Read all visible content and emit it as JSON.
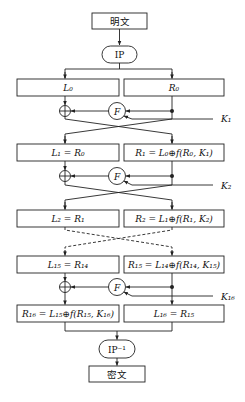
{
  "diagram": {
    "plaintext_label": "明文",
    "ciphertext_label": "密文",
    "initial_permutation": "IP",
    "final_permutation": "IP⁻¹",
    "round_function_label": "F",
    "rounds": [
      {
        "index": 0,
        "left": "L₀",
        "right": "R₀",
        "key": "K₁"
      },
      {
        "index": 1,
        "left": "L₁ = R₀",
        "right": "R₁ = L₀⊕f(R₀, K₁)",
        "key": "K₂"
      },
      {
        "index": 2,
        "left": "L₂ = R₁",
        "right": "R₂ = L₁⊕f(R₁, K₂)"
      },
      {
        "index": 15,
        "left": "L₁₅ = R₁₄",
        "right": "R₁₅ = L₁₄⊕f(R₁₄, K₁₅)",
        "key": "K₁₆"
      },
      {
        "index": 16,
        "left": "R₁₆ = L₁₅⊕f(R₁₅, K₁₆)",
        "right": "L₁₆ = R₁₅"
      }
    ],
    "colors": {
      "stroke": "#222222",
      "background": "#ffffff",
      "text": "#111111"
    }
  }
}
